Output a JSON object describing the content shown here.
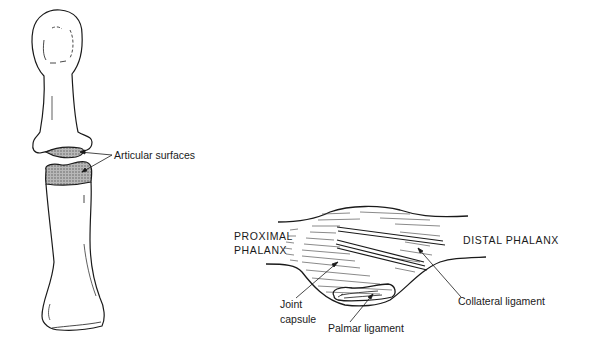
{
  "figure": {
    "left_panel": {
      "description": "Interphalangeal joint bones, separated",
      "labels": {
        "articular_surfaces": "Articular surfaces"
      }
    },
    "right_panel": {
      "description": "Interphalangeal joint, lateral view with ligaments",
      "labels": {
        "proximal_line1": "PROXIMAL",
        "proximal_line2": "PHALANX",
        "distal": "DISTAL PHALANX",
        "joint_line1": "Joint",
        "joint_line2": "capsule",
        "palmar": "Palmar ligament",
        "collateral": "Collateral ligament"
      }
    },
    "colors": {
      "ink": "#1a1a1a",
      "shading": "#9a9a9a",
      "background": "#ffffff"
    }
  }
}
